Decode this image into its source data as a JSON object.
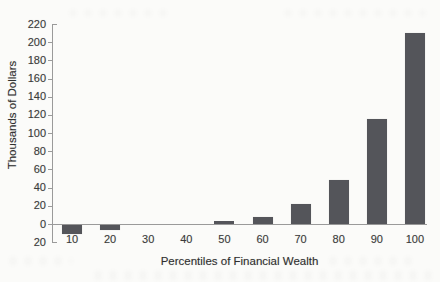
{
  "figure": {
    "background": "#fbfbf9",
    "bar_color": "#54555a",
    "axis_color": "#9a9a9a",
    "text_color": "#3a3a3a"
  },
  "chart_data": {
    "type": "bar",
    "title": "",
    "xlabel": "Percentiles of Financial Wealth",
    "ylabel": "Thousands of Dollars",
    "categories": [
      "10",
      "20",
      "30",
      "40",
      "50",
      "60",
      "70",
      "80",
      "90",
      "100"
    ],
    "values": [
      -10,
      -6,
      0,
      0,
      3,
      8,
      22,
      48,
      115,
      210
    ],
    "ylim": [
      -20,
      220
    ],
    "ytick_step": 20,
    "ytick_values": [
      220,
      200,
      180,
      160,
      140,
      120,
      100,
      80,
      60,
      40,
      20,
      0,
      -20
    ],
    "ytick_labels": [
      "220",
      "200",
      "180",
      "160",
      "140",
      "120",
      "100",
      "80",
      "60",
      "40",
      "20",
      "0",
      "20"
    ],
    "grid": false,
    "legend": "none",
    "bar_color": "#54555a"
  }
}
